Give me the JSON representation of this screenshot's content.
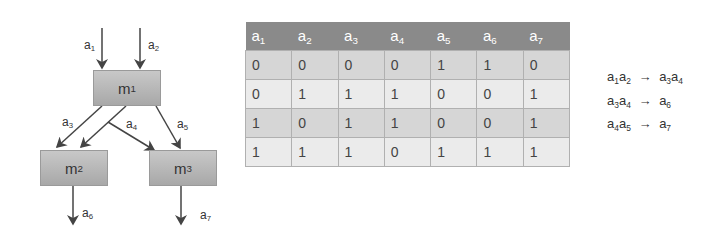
{
  "diagram": {
    "nodes": [
      {
        "id": "m1",
        "label": "m",
        "sub": "1"
      },
      {
        "id": "m2",
        "label": "m",
        "sub": "2"
      },
      {
        "id": "m3",
        "label": "m",
        "sub": "3"
      }
    ],
    "edges": [
      {
        "label": "a",
        "sub": "1"
      },
      {
        "label": "a",
        "sub": "2"
      },
      {
        "label": "a",
        "sub": "3"
      },
      {
        "label": "a",
        "sub": "4"
      },
      {
        "label": "a",
        "sub": "5"
      },
      {
        "label": "a",
        "sub": "6"
      },
      {
        "label": "a",
        "sub": "7"
      }
    ]
  },
  "table": {
    "headers": [
      {
        "label": "a",
        "sub": "1"
      },
      {
        "label": "a",
        "sub": "2"
      },
      {
        "label": "a",
        "sub": "3"
      },
      {
        "label": "a",
        "sub": "4"
      },
      {
        "label": "a",
        "sub": "5"
      },
      {
        "label": "a",
        "sub": "6"
      },
      {
        "label": "a",
        "sub": "7"
      }
    ],
    "rows": [
      [
        "0",
        "0",
        "0",
        "0",
        "1",
        "1",
        "0"
      ],
      [
        "0",
        "1",
        "1",
        "1",
        "0",
        "0",
        "1"
      ],
      [
        "1",
        "0",
        "1",
        "1",
        "0",
        "0",
        "1"
      ],
      [
        "1",
        "1",
        "1",
        "0",
        "1",
        "1",
        "1"
      ]
    ]
  },
  "rules": [
    {
      "lhs": [
        [
          "a",
          "1"
        ],
        [
          "a",
          "2"
        ]
      ],
      "arrow": "→",
      "rhs": [
        [
          "a",
          "3"
        ],
        [
          "a",
          "4"
        ]
      ]
    },
    {
      "lhs": [
        [
          "a",
          "3"
        ],
        [
          "a",
          "4"
        ]
      ],
      "arrow": "→",
      "rhs": [
        [
          "a",
          "6"
        ]
      ]
    },
    {
      "lhs": [
        [
          "a",
          "4"
        ],
        [
          "a",
          "5"
        ]
      ],
      "arrow": "→",
      "rhs": [
        [
          "a",
          "7"
        ]
      ]
    }
  ],
  "colors": {
    "header_bg": "#8a8a8a",
    "row_dark": "#d6d6d6",
    "row_light": "#ebebeb",
    "box": "#b8b8b8"
  }
}
